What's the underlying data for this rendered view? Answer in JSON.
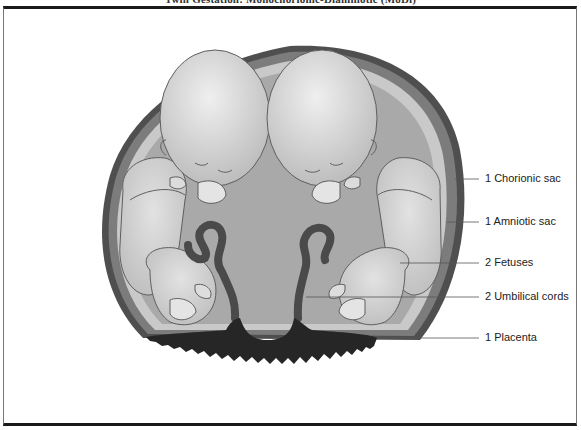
{
  "figure": {
    "title": "Twin Gestation: Monochorionic-Diamniotic (MoDi)"
  },
  "labels": [
    {
      "id": "chorionic-sac",
      "text": "1 Chorionic sac",
      "x": 485,
      "y": 172,
      "line_from_x": 455,
      "line_y": 179
    },
    {
      "id": "amniotic-sac",
      "text": "1 Amniotic sac",
      "x": 485,
      "y": 216,
      "line_from_x": 455,
      "line_y": 222
    },
    {
      "id": "fetuses",
      "text": "2 Fetuses",
      "x": 485,
      "y": 256,
      "line_from_x": 400,
      "line_y": 263
    },
    {
      "id": "umbilical-cords",
      "text": "2 Umbilical cords",
      "x": 485,
      "y": 290,
      "line_from_x": 306,
      "line_y": 297
    },
    {
      "id": "placenta",
      "text": "1 Placenta",
      "x": 485,
      "y": 331,
      "line_from_x": 378,
      "line_y": 338
    }
  ],
  "colors": {
    "outer_edge": "#4f4f4f",
    "chorion": "#7c7c7c",
    "amnion": "#c9c9c9",
    "fluid": "#a9a9a9",
    "fetus_skin": "#d4d4d4",
    "fetus_outline": "#5e5e5e",
    "cord": "#4a4a4a",
    "placenta": "#262626",
    "leader_line": "#555555"
  }
}
